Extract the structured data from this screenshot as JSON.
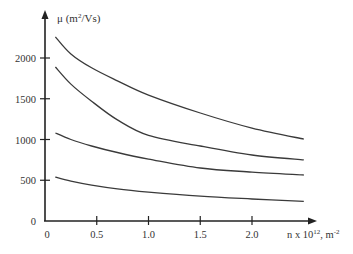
{
  "chart_data": {
    "type": "line",
    "title": "",
    "xlabel": "n x 10^12, m^-2",
    "xlabel_parts": {
      "base": "n x 10",
      "sup1": "12",
      "mid": ", m",
      "sup2": "-2"
    },
    "ylabel": "μ (m^2/Vs)",
    "ylabel_parts": {
      "base": "μ (m",
      "sup": "2",
      "tail": "/Vs)"
    },
    "xlim": [
      0,
      2.6
    ],
    "ylim": [
      0,
      2400
    ],
    "x_ticks": [
      0.5,
      1.0,
      1.5,
      2.0
    ],
    "x_tick_labels": [
      "0",
      "0.5",
      "1.0",
      "1.5",
      "2.0"
    ],
    "y_ticks": [
      500,
      1000,
      1500,
      2000
    ],
    "y_tick_labels": [
      "0",
      "500",
      "1000",
      "1500",
      "2000"
    ],
    "grid": false,
    "legend": null,
    "x": [
      0.1,
      0.25,
      0.45,
      0.7,
      1.0,
      1.5,
      2.0,
      2.5
    ],
    "series": [
      {
        "name": "curve-1",
        "values": [
          2260,
          2050,
          1880,
          1720,
          1545,
          1325,
          1140,
          1005
        ]
      },
      {
        "name": "curve-2",
        "values": [
          1890,
          1680,
          1470,
          1240,
          1050,
          920,
          810,
          750
        ]
      },
      {
        "name": "curve-3",
        "values": [
          1080,
          1000,
          920,
          840,
          760,
          650,
          600,
          565
        ]
      },
      {
        "name": "curve-4",
        "values": [
          540,
          490,
          440,
          395,
          355,
          305,
          270,
          240
        ]
      }
    ]
  },
  "colors": {
    "line": "#3a3a3a",
    "axis": "#222222",
    "text": "#333333"
  }
}
